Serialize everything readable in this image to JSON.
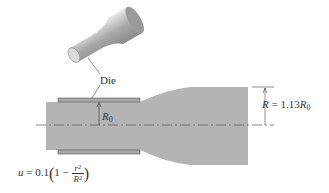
{
  "figure": {
    "callout_label": "Die",
    "inner_radius_label": "R",
    "inner_radius_subscript": "0",
    "outer_radius_label": "R",
    "outer_radius_eq": " = 1.13",
    "outer_radius_ref": "R",
    "outer_radius_ref_sub": "0",
    "velocity_eq": {
      "lhs": "u",
      "eq": " = 0.1",
      "one_minus": "1 − ",
      "numerator": "r²",
      "denominator": "R²"
    },
    "colors": {
      "fluid": "#b4b4b4",
      "die": "#a8a8a8",
      "line": "#444444"
    }
  }
}
